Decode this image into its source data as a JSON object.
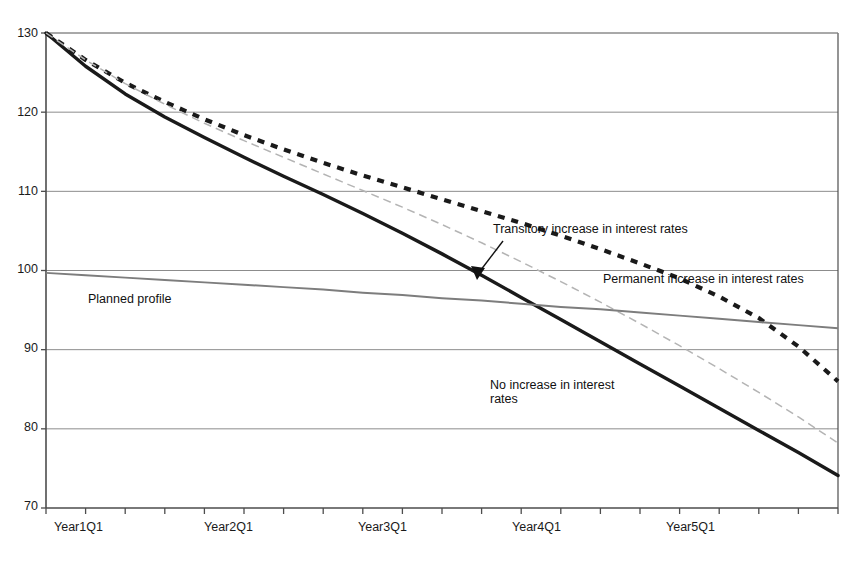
{
  "chart_data": {
    "type": "line",
    "title": "",
    "xlabel": "",
    "ylabel": "",
    "ylim": [
      70,
      130
    ],
    "yticks": [
      70,
      80,
      90,
      100,
      110,
      120,
      130
    ],
    "ytick_labels": [
      "70",
      "80",
      "90",
      "100",
      "110",
      "120",
      "130"
    ],
    "grid": "horizontal",
    "legend_position": "inline-annotations",
    "x": [
      "Year1Q1",
      "Year1Q2",
      "Year1Q3",
      "Year1Q4",
      "Year2Q1",
      "Year2Q2",
      "Year2Q3",
      "Year2Q4",
      "Year3Q1",
      "Year3Q2",
      "Year3Q3",
      "Year3Q4",
      "Year4Q1",
      "Year4Q2",
      "Year4Q3",
      "Year4Q4",
      "Year5Q1",
      "Year5Q2",
      "Year5Q3",
      "Year5Q4",
      "Year6Q1"
    ],
    "xtick_labels": [
      "Year1Q1",
      "Year2Q1",
      "Year3Q1",
      "Year4Q1",
      "Year5Q1"
    ],
    "xtick_positions": [
      0,
      4,
      8,
      12,
      16
    ],
    "series": [
      {
        "name": "No increase in interest rates",
        "style": "solid-thick-black",
        "color": "#1a1a1a",
        "values": [
          130.0,
          125.8,
          122.3,
          119.4,
          116.8,
          114.3,
          111.9,
          109.6,
          107.2,
          104.7,
          102.1,
          99.4,
          96.6,
          93.8,
          91.0,
          88.2,
          85.4,
          82.6,
          79.8,
          77.0,
          74.1
        ]
      },
      {
        "name": "Transitory increase in interest rates",
        "style": "dotted-thick-black",
        "color": "#1a1a1a",
        "values": [
          130.0,
          126.6,
          123.7,
          121.3,
          119.1,
          117.1,
          115.3,
          113.6,
          112.0,
          110.5,
          109.0,
          107.5,
          106.0,
          104.4,
          102.7,
          100.9,
          99.0,
          96.7,
          94.0,
          90.4,
          86.0
        ]
      },
      {
        "name": "Permanent increase in interest rates",
        "style": "dashed-thin-gray",
        "color": "#b4b4b4",
        "values": [
          130.0,
          126.6,
          123.6,
          121.0,
          118.6,
          116.4,
          114.3,
          112.2,
          110.1,
          108.0,
          105.8,
          103.5,
          101.1,
          98.6,
          96.0,
          93.3,
          90.5,
          87.6,
          84.6,
          81.5,
          78.2
        ]
      },
      {
        "name": "Planned profile",
        "style": "solid-thin-gray",
        "color": "#7d7d7d",
        "values": [
          99.7,
          99.4,
          99.1,
          98.8,
          98.5,
          98.2,
          97.9,
          97.6,
          97.2,
          96.9,
          96.5,
          96.2,
          95.8,
          95.4,
          95.1,
          94.7,
          94.3,
          93.9,
          93.5,
          93.1,
          92.7
        ]
      }
    ],
    "annotations": [
      {
        "id": "transitory",
        "text": "Transitory increase in interest rates",
        "has_arrow": true
      },
      {
        "id": "permanent",
        "text": "Permanent increase in interest rates",
        "has_arrow": false
      },
      {
        "id": "planned",
        "text": "Planned profile",
        "has_arrow": false
      },
      {
        "id": "no-increase",
        "text": "No increase in interest\nrates",
        "has_arrow": false
      }
    ]
  },
  "axis": {
    "y_labels": [
      "130",
      "120",
      "110",
      "100",
      "90",
      "80",
      "70"
    ],
    "x_labels": [
      "Year1Q1",
      "Year2Q1",
      "Year3Q1",
      "Year4Q1",
      "Year5Q1"
    ]
  },
  "annotations": {
    "transitory": "Transitory increase in interest rates",
    "permanent": "Permanent increase in interest rates",
    "planned": "Planned profile",
    "no_increase_line1": "No increase in interest",
    "no_increase_line2": "rates"
  },
  "colors": {
    "axis": "#4d4d4d",
    "grid": "#8c8c8c",
    "no_increase": "#1a1a1a",
    "transitory": "#1a1a1a",
    "permanent": "#b4b4b4",
    "planned": "#7d7d7d",
    "text": "#141414"
  }
}
